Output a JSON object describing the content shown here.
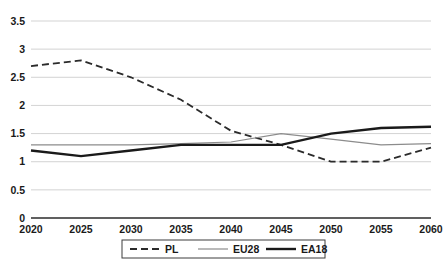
{
  "chart_data": {
    "type": "line",
    "title": "",
    "subtitle": "",
    "xlabel": "",
    "ylabel": "",
    "x": [
      2020,
      2025,
      2030,
      2035,
      2040,
      2045,
      2050,
      2055,
      2060
    ],
    "categories": [
      "2020",
      "2025",
      "2030",
      "2035",
      "2040",
      "2045",
      "2050",
      "2055",
      "2060"
    ],
    "xlim": [
      2020,
      2060
    ],
    "ylim": [
      0,
      3.5
    ],
    "yticks": [
      0,
      0.5,
      1,
      1.5,
      2,
      2.5,
      3,
      3.5
    ],
    "ytick_labels": [
      "0",
      "0.5",
      "1",
      "1.5",
      "2",
      "2.5",
      "3",
      "3.5"
    ],
    "grid": true,
    "grid_axis": "y",
    "legend_position": "bottom",
    "series": [
      {
        "name": "PL",
        "style": "dashed",
        "color": "#2b2b2b",
        "width": 1.8,
        "values": [
          2.7,
          2.8,
          2.5,
          2.1,
          1.55,
          1.3,
          1.0,
          1.0,
          1.25
        ]
      },
      {
        "name": "EU28",
        "style": "solid",
        "color": "#8c8c8c",
        "width": 1.2,
        "values": [
          1.3,
          1.3,
          1.3,
          1.32,
          1.35,
          1.5,
          1.4,
          1.3,
          1.32
        ]
      },
      {
        "name": "EA18",
        "style": "solid",
        "color": "#1a1a1a",
        "width": 2.4,
        "values": [
          1.2,
          1.1,
          1.2,
          1.3,
          1.3,
          1.3,
          1.5,
          1.6,
          1.62
        ]
      }
    ]
  },
  "axes": {
    "y_labels": [
      "3.5",
      "3",
      "2.5",
      "2",
      "1.5",
      "1",
      "0.5",
      "0"
    ],
    "x_labels": [
      "2020",
      "2025",
      "2030",
      "2035",
      "2040",
      "2045",
      "2050",
      "2055",
      "2060"
    ]
  },
  "legend": {
    "items": [
      {
        "label": "PL",
        "style": "dashed",
        "color": "#2b2b2b"
      },
      {
        "label": "EU28",
        "style": "solid",
        "color": "#8c8c8c"
      },
      {
        "label": "EA18",
        "style": "solid",
        "color": "#1a1a1a"
      }
    ]
  },
  "colors": {
    "background": "#ffffff",
    "gridline": "#c8c8c8",
    "axis": "#2b2b2b",
    "text": "#1a1a1a",
    "pl": "#2b2b2b",
    "eu28": "#8c8c8c",
    "ea18": "#1a1a1a"
  }
}
